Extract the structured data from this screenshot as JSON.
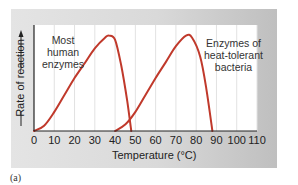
{
  "chart_data": {
    "type": "line",
    "title": "",
    "xlabel": "Temperature (°C)",
    "ylabel": "Rate of reaction",
    "xlim": [
      0,
      110
    ],
    "ylim": [
      0,
      1
    ],
    "xticks": [
      "0",
      "10",
      "20",
      "30",
      "40",
      "50",
      "60",
      "70",
      "80",
      "90",
      "100",
      "110"
    ],
    "grid": "vertical",
    "series": [
      {
        "name": "Most human enzymes",
        "color": "#c0392b",
        "x": [
          0,
          5,
          10,
          15,
          20,
          25,
          30,
          35,
          37,
          40,
          43,
          46,
          48
        ],
        "y": [
          0,
          0.05,
          0.18,
          0.34,
          0.5,
          0.64,
          0.78,
          0.88,
          0.9,
          0.86,
          0.62,
          0.28,
          0
        ]
      },
      {
        "name": "Enzymes of heat-tolerant bacteria",
        "color": "#c0392b",
        "x": [
          40,
          45,
          50,
          55,
          60,
          65,
          70,
          75,
          78,
          82,
          85,
          88
        ],
        "y": [
          0,
          0.06,
          0.18,
          0.34,
          0.5,
          0.65,
          0.8,
          0.9,
          0.88,
          0.7,
          0.4,
          0
        ]
      }
    ],
    "annotations": [
      {
        "lines": [
          "Most",
          "human",
          "enzymes"
        ]
      },
      {
        "lines": [
          "Enzymes of",
          "heat-tolerant",
          "bacteria"
        ]
      }
    ]
  },
  "caption": "(a)"
}
